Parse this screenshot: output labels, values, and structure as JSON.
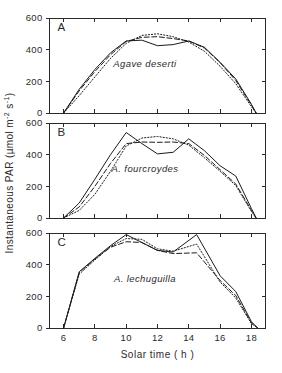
{
  "figure": {
    "ylabel": "Instantaneous PAR  (µmol m⁻² s⁻¹)",
    "ylabel_main": "Instantaneous PAR  (µmol m",
    "ylabel_sup1": "-2",
    "ylabel_mid": " s",
    "ylabel_sup2": "-1",
    "ylabel_end": ")",
    "xlabel": "Solar time  ( h )",
    "line_color": "#1a1a1a",
    "axis_color": "#2b2b2b",
    "background": "#ffffff"
  },
  "chart_data": [
    {
      "type": "line",
      "panel": "A",
      "panel_label": "A",
      "annotation": "Agave deserti",
      "title": "",
      "xlabel": "Solar time  ( h )",
      "ylabel": "Instantaneous PAR  (µmol m-2 s-1)",
      "xlim": [
        5.1,
        18.9
      ],
      "ylim": [
        0,
        600
      ],
      "xticks": [
        6,
        8,
        10,
        12,
        14,
        16,
        18
      ],
      "xticklabels": [
        "6",
        "8",
        "10",
        "12",
        "14",
        "16",
        "18"
      ],
      "yticks": [
        0,
        200,
        400,
        600
      ],
      "yticklabels": [
        "0",
        "200",
        "400",
        "600"
      ],
      "grid": false,
      "legend": "none",
      "series": [
        {
          "name": "solid",
          "style": "solid",
          "x": [
            6.0,
            7.0,
            8.0,
            9.0,
            10.0,
            11.0,
            12.0,
            13.0,
            14.0,
            15.0,
            16.0,
            17.0,
            18.0,
            18.3
          ],
          "y": [
            0,
            150,
            275,
            380,
            455,
            460,
            425,
            432,
            455,
            415,
            320,
            215,
            55,
            0
          ]
        },
        {
          "name": "dashed",
          "style": "dashed",
          "x": [
            6.0,
            7.0,
            8.0,
            9.0,
            10.0,
            11.0,
            12.0,
            13.0,
            14.0,
            15.0,
            16.0,
            17.0,
            18.0,
            18.3
          ],
          "y": [
            0,
            140,
            262,
            368,
            452,
            478,
            482,
            470,
            455,
            410,
            318,
            205,
            50,
            0
          ]
        },
        {
          "name": "dotted",
          "style": "dotted",
          "x": [
            6.0,
            7.0,
            8.0,
            9.0,
            10.0,
            11.0,
            12.0,
            13.0,
            14.0,
            15.0,
            16.0,
            17.0,
            18.0,
            18.3
          ],
          "y": [
            0,
            110,
            228,
            345,
            440,
            490,
            500,
            482,
            448,
            390,
            295,
            185,
            40,
            0
          ]
        }
      ]
    },
    {
      "type": "line",
      "panel": "B",
      "panel_label": "B",
      "annotation": "A. fourcroydes",
      "title": "",
      "xlabel": "Solar time  ( h )",
      "ylabel": "Instantaneous PAR  (µmol m-2 s-1)",
      "xlim": [
        5.1,
        18.9
      ],
      "ylim": [
        0,
        600
      ],
      "xticks": [
        6,
        8,
        10,
        12,
        14,
        16,
        18
      ],
      "xticklabels": [
        "6",
        "8",
        "10",
        "12",
        "14",
        "16",
        "18"
      ],
      "yticks": [
        0,
        200,
        400,
        600
      ],
      "yticklabels": [
        "0",
        "200",
        "400",
        "600"
      ],
      "grid": false,
      "legend": "none",
      "series": [
        {
          "name": "solid",
          "style": "solid",
          "x": [
            6.0,
            7.0,
            8.0,
            9.0,
            10.0,
            11.0,
            12.0,
            13.0,
            14.0,
            15.0,
            16.0,
            17.0,
            18.0,
            18.3
          ],
          "y": [
            0,
            95,
            245,
            400,
            540,
            470,
            405,
            415,
            500,
            425,
            330,
            265,
            60,
            0
          ]
        },
        {
          "name": "dashed",
          "style": "dashed",
          "x": [
            6.0,
            7.0,
            8.0,
            9.0,
            10.0,
            11.0,
            12.0,
            13.0,
            14.0,
            15.0,
            16.0,
            17.0,
            18.0,
            18.3
          ],
          "y": [
            0,
            70,
            200,
            345,
            470,
            480,
            478,
            480,
            470,
            395,
            305,
            215,
            48,
            0
          ]
        },
        {
          "name": "dotted",
          "style": "dotted",
          "x": [
            6.0,
            7.0,
            8.0,
            9.0,
            10.0,
            11.0,
            12.0,
            13.0,
            14.0,
            15.0,
            16.0,
            17.0,
            18.0,
            18.3
          ],
          "y": [
            0,
            48,
            150,
            295,
            455,
            505,
            515,
            500,
            460,
            380,
            295,
            205,
            42,
            0
          ]
        }
      ]
    },
    {
      "type": "line",
      "panel": "C",
      "panel_label": "C",
      "annotation": "A. lechuguilla",
      "title": "",
      "xlabel": "Solar time  ( h )",
      "ylabel": "Instantaneous PAR  (µmol m-2 s-1)",
      "xlim": [
        5.1,
        18.9
      ],
      "ylim": [
        0,
        600
      ],
      "xticks": [
        6,
        8,
        10,
        12,
        14,
        16,
        18
      ],
      "xticklabels": [
        "6",
        "8",
        "10",
        "12",
        "14",
        "16",
        "18"
      ],
      "yticks": [
        0,
        200,
        400,
        600
      ],
      "yticklabels": [
        "0",
        "200",
        "400",
        "600"
      ],
      "grid": false,
      "legend": "none",
      "series": [
        {
          "name": "solid",
          "style": "solid",
          "x": [
            6.0,
            7.0,
            8.0,
            9.0,
            10.0,
            11.0,
            12.0,
            13.0,
            14.5,
            16.0,
            17.0,
            18.0,
            18.4
          ],
          "y": [
            0,
            355,
            440,
            520,
            590,
            540,
            490,
            480,
            590,
            330,
            230,
            40,
            0
          ]
        },
        {
          "name": "dashed",
          "style": "dashed",
          "x": [
            6.0,
            7.0,
            8.0,
            9.0,
            10.0,
            11.0,
            12.0,
            13.0,
            14.5,
            16.0,
            17.0,
            18.0,
            18.4
          ],
          "y": [
            0,
            350,
            435,
            510,
            545,
            540,
            490,
            470,
            475,
            300,
            205,
            32,
            0
          ]
        },
        {
          "name": "dotted",
          "style": "dotted",
          "x": [
            6.0,
            7.0,
            8.0,
            9.0,
            10.0,
            11.0,
            12.0,
            13.0,
            14.5,
            16.0,
            17.0,
            18.0,
            18.4
          ],
          "y": [
            0,
            340,
            430,
            515,
            565,
            560,
            500,
            485,
            530,
            290,
            190,
            28,
            0
          ]
        }
      ]
    }
  ]
}
